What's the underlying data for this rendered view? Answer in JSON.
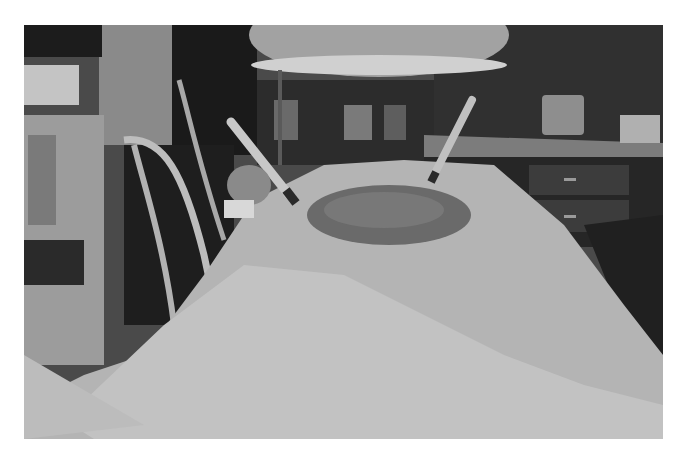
{
  "image": {
    "kind": "photograph",
    "color_mode": "grayscale",
    "description": "Operating room scene: draped patient on surgical table with two syringes inserted into an exposed surgical site, overhead surgical lamp, medical equipment and tubing on left, counter with cabinets and containers in background",
    "frame": {
      "x": 24,
      "y": 25,
      "width": 639,
      "height": 414
    },
    "background_color": "#ffffff",
    "elements": [
      {
        "name": "surgical-lamp",
        "shade": "#9a9a9a"
      },
      {
        "name": "surgical-drape",
        "shade": "#b4b4b4"
      },
      {
        "name": "surgical-site",
        "shade": "#6a6a6a"
      },
      {
        "name": "syringe-left",
        "shade": "#c8c8c8"
      },
      {
        "name": "syringe-right",
        "shade": "#c0c0c0"
      },
      {
        "name": "tubing",
        "shade": "#bdbdbd"
      },
      {
        "name": "equipment-cart",
        "shade": "#a0a0a0"
      },
      {
        "name": "background-counter",
        "shade": "#3a3a3a"
      },
      {
        "name": "container-jar",
        "shade": "#8e8e8e"
      },
      {
        "name": "small-box",
        "shade": "#b0b0b0"
      }
    ]
  }
}
